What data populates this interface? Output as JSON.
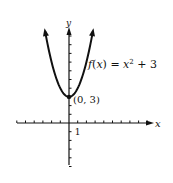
{
  "chart_data": {
    "type": "line",
    "title": "",
    "function": "f(x) = x^2 + 3",
    "label": "f(x) = x² + 3",
    "vertex": {
      "x": 0,
      "y": 3,
      "label": "(0, 3)"
    },
    "xlabel": "x",
    "ylabel": "y",
    "xlim": [
      -6,
      9
    ],
    "ylim": [
      -5,
      11
    ],
    "tick_label": "1",
    "x": [
      -2.75,
      -2,
      -1,
      0,
      1,
      2,
      2.75
    ],
    "y": [
      10.5625,
      7,
      4,
      3,
      4,
      7,
      10.5625
    ],
    "grid": false
  }
}
